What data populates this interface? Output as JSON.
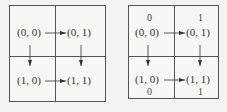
{
  "left_grid": {
    "cells": [
      {
        "label": "(0, 0)"
      },
      {
        "label": "(0, 1)"
      },
      {
        "label": "(1, 0)"
      },
      {
        "label": "(1, 1)"
      }
    ]
  },
  "right_grid": {
    "cells": [
      {
        "label": "(0, 0)",
        "value": "0"
      },
      {
        "label": "(0, 1)",
        "value": "1"
      },
      {
        "label": "(1, 0)",
        "value": "0"
      },
      {
        "label": "(1, 1)",
        "value": "1"
      }
    ]
  },
  "colors": {
    "line": "#555555",
    "text": "#333333",
    "background": "#f4f4f2"
  }
}
